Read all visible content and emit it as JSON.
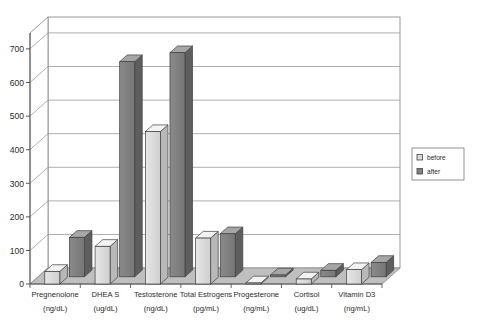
{
  "chart_data": {
    "type": "bar",
    "title": "",
    "subtitle": "",
    "xlabel": "",
    "ylabel": "",
    "ylim": [
      0,
      700
    ],
    "yticks": [
      0,
      100,
      200,
      300,
      400,
      500,
      600,
      700
    ],
    "grid": true,
    "three_d": true,
    "legend_position": "right",
    "categories": [
      "Pregnenolone\n(ng/dL)",
      "DHEA S\n(ug/dL)",
      "Testosterone\n(ng/dL)",
      "Total Estrogens\n(pg/mL)",
      "Progesterone\n(ng/mL)",
      "Cortisol\n(ug/dL)",
      "Vitamin D3\n(ng/mL)"
    ],
    "category_names": [
      "Pregnenolone",
      "DHEA S",
      "Testosterone",
      "Total Estrogens",
      "Progesterone",
      "Cortisol",
      "Vitamin D3"
    ],
    "category_units": [
      "(ng/dL)",
      "(ug/dL)",
      "(ng/dL)",
      "(pg/mL)",
      "(ng/mL)",
      "(ug/dL)",
      "(ng/mL)"
    ],
    "series": [
      {
        "name": "before",
        "color": "#d9d9d9",
        "values": [
          35,
          105,
          425,
          128,
          3,
          14,
          40
        ]
      },
      {
        "name": "after",
        "color": "#808080",
        "values": [
          110,
          600,
          625,
          120,
          5,
          18,
          40
        ]
      }
    ]
  },
  "legend": {
    "items": [
      {
        "label": "before",
        "swatch": "legend-swatch-before"
      },
      {
        "label": "after",
        "swatch": "legend-swatch-after"
      }
    ]
  },
  "axis": {
    "y_tick_labels": [
      "0",
      "100",
      "200",
      "300",
      "400",
      "500",
      "600",
      "700"
    ]
  },
  "colors": {
    "before_face": "#d9d9d9",
    "before_top": "#f0f0f0",
    "before_side": "#bdbdbd",
    "after_face": "#808080",
    "after_top": "#a8a8a8",
    "after_side": "#636363",
    "floor": "#bfbfbf",
    "wall": "#ffffff",
    "gridline": "#9a9a9a",
    "border": "#555555"
  }
}
